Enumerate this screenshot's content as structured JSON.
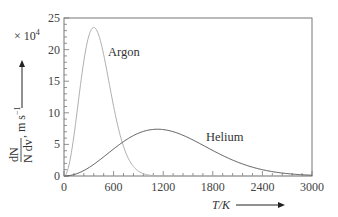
{
  "chart_data": {
    "type": "line",
    "title": "",
    "xlabel": "T/K",
    "ylabel": "dN/(N dv), m s^-1",
    "y_multiplier": "× 10⁴",
    "xlim": [
      0,
      3000
    ],
    "ylim": [
      0,
      25
    ],
    "x_ticks": [
      0,
      600,
      1200,
      1800,
      2400,
      3000
    ],
    "y_ticks": [
      0,
      5,
      10,
      15,
      20,
      25
    ],
    "x_minor_step": 120,
    "y_minor_step": 1,
    "grid": false,
    "legend": "inline labels",
    "x": [
      0,
      120,
      240,
      360,
      480,
      600,
      720,
      840,
      960,
      1080,
      1200,
      1320,
      1440,
      1560,
      1680,
      1800,
      1920,
      2040,
      2160,
      2280,
      2400,
      2520,
      2640,
      2760,
      2880,
      3000
    ],
    "series": [
      {
        "name": "Argon",
        "color": "#b0b0b0",
        "values": [
          0,
          6.35,
          18.2,
          23.5,
          19.2,
          11.0,
          4.68,
          1.5,
          0.37,
          0.07,
          0.01,
          0,
          0,
          0,
          0,
          0,
          0,
          0,
          0,
          0,
          0,
          0,
          0,
          0,
          0,
          0
        ],
        "peak": {
          "x": 360,
          "y": 23.5
        }
      },
      {
        "name": "Helium",
        "color": "#555555",
        "values": [
          0,
          0.22,
          0.87,
          1.84,
          3.03,
          4.28,
          5.44,
          6.4,
          7.06,
          7.37,
          7.34,
          7.01,
          6.44,
          5.7,
          4.88,
          4.04,
          3.24,
          2.52,
          1.9,
          1.4,
          1.0,
          0.69,
          0.47,
          0.31,
          0.2,
          0.12
        ],
        "peak": {
          "x": 1130,
          "y": 7.4
        }
      }
    ]
  },
  "labels": {
    "argon": "Argon",
    "helium": "Helium",
    "multiplier": "× 10",
    "multiplier_exp": "4",
    "ylabel_num": "dN",
    "ylabel_den": "N dv",
    "ylabel_unit": ", m s",
    "ylabel_unit_exp": "−1",
    "xlabel": "T/K"
  }
}
